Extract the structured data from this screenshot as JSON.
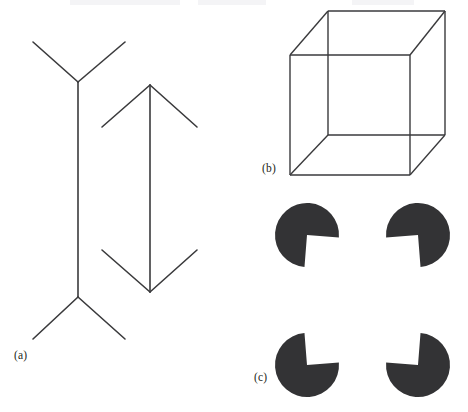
{
  "figure": {
    "caption_labels": {
      "a": "(a)",
      "b": "(b)",
      "c": "(c)"
    },
    "colors": {
      "background": "#ffffff",
      "stroke": "#3a3a3c",
      "fill_dark": "#333335",
      "label_text": "#231f20"
    },
    "canvas": {
      "width": 468,
      "height": 412
    }
  },
  "panels": [
    {
      "id": "a",
      "label": "(a)",
      "name": "muller-lyer-illusion",
      "illusion_type": "Müller-Lyer",
      "elements": {
        "left_figure": {
          "name": "fins-outward-line",
          "shaft": {
            "x": 78,
            "y_top": 82,
            "y_bottom": 297
          },
          "top_fins": [
            {
              "x1": 78,
              "y1": 82,
              "x2": 33,
              "y2": 42
            },
            {
              "x1": 78,
              "y1": 82,
              "x2": 125,
              "y2": 42
            }
          ],
          "bottom_fins": [
            {
              "x1": 78,
              "y1": 297,
              "x2": 33,
              "y2": 339
            },
            {
              "x1": 78,
              "y1": 297,
              "x2": 125,
              "y2": 339
            }
          ]
        },
        "right_figure": {
          "name": "arrowheads-inward-line",
          "shaft": {
            "x": 150,
            "y_top": 85,
            "y_bottom": 292
          },
          "top_arrowhead": [
            {
              "x1": 150,
              "y1": 85,
              "x2": 102,
              "y2": 127
            },
            {
              "x1": 150,
              "y1": 85,
              "x2": 197,
              "y2": 127
            }
          ],
          "bottom_arrowhead": [
            {
              "x1": 150,
              "y1": 292,
              "x2": 102,
              "y2": 250
            },
            {
              "x1": 150,
              "y1": 292,
              "x2": 197,
              "y2": 250
            }
          ]
        }
      }
    },
    {
      "id": "b",
      "label": "(b)",
      "name": "necker-cube",
      "illusion_type": "Necker cube",
      "vertices": {
        "front_top_left": [
          290,
          55
        ],
        "front_top_right": [
          410,
          55
        ],
        "front_bottom_left": [
          290,
          175
        ],
        "front_bottom_right": [
          410,
          175
        ],
        "back_top_left": [
          328,
          11
        ],
        "back_top_right": [
          445,
          11
        ],
        "back_bottom_left": [
          328,
          135
        ],
        "back_bottom_right": [
          445,
          135
        ]
      }
    },
    {
      "id": "c",
      "label": "(c)",
      "name": "kanizsa-square",
      "illusion_type": "Kanizsa square",
      "disc_radius": 32,
      "wedge_angle_deg": 90,
      "discs": [
        {
          "name": "pacman-top-left",
          "cx": 307,
          "cy": 235,
          "wedge_facing": "down-right"
        },
        {
          "name": "pacman-top-right",
          "cx": 418,
          "cy": 235,
          "wedge_facing": "down-left"
        },
        {
          "name": "pacman-bottom-left",
          "cx": 307,
          "cy": 365,
          "wedge_facing": "up-right"
        },
        {
          "name": "pacman-bottom-right",
          "cx": 418,
          "cy": 365,
          "wedge_facing": "up-left"
        }
      ]
    }
  ]
}
